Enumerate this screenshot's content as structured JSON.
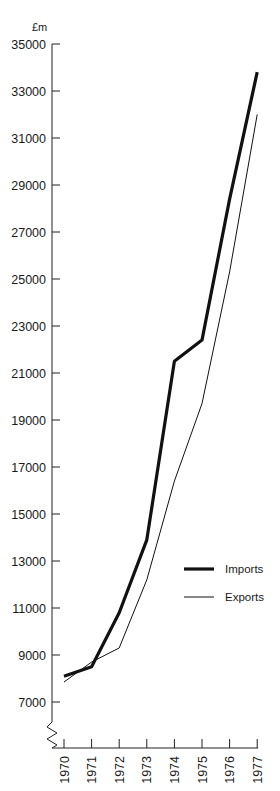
{
  "chart_data": {
    "type": "line",
    "title": "",
    "xlabel": "",
    "ylabel": "£m",
    "x": [
      "1970",
      "1971",
      "1972",
      "1973",
      "1974",
      "1975",
      "1976",
      "1977"
    ],
    "series": [
      {
        "name": "Imports",
        "style": "thick",
        "color": "#111111",
        "values": [
          8100,
          8500,
          10800,
          13900,
          21500,
          22400,
          28400,
          33800
        ]
      },
      {
        "name": "Exports",
        "style": "thin",
        "color": "#111111",
        "values": [
          7850,
          8700,
          9300,
          12200,
          16400,
          19700,
          25300,
          32000
        ]
      }
    ],
    "yticks": [
      7000,
      9000,
      11000,
      13000,
      15000,
      17000,
      19000,
      21000,
      23000,
      25000,
      27000,
      29000,
      31000,
      33000,
      35000
    ],
    "ylim": [
      5500,
      35000
    ],
    "y_axis_break": true,
    "grid": false,
    "legend_position": "lower right inside"
  },
  "axis": {
    "unit_label": "£m"
  },
  "legend": {
    "items": [
      {
        "label": "Imports"
      },
      {
        "label": "Exports"
      }
    ]
  }
}
